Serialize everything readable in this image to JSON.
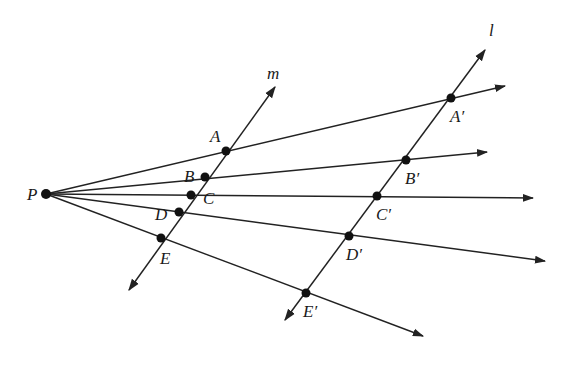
{
  "diagram": {
    "type": "geometry",
    "stroke_color": "#222222",
    "point_color": "#111111",
    "origin": {
      "label": "P",
      "x": 46,
      "y": 194,
      "label_x": 27,
      "label_y": 186
    },
    "lines": [
      {
        "name": "m",
        "label": "m",
        "x1": 129,
        "y1": 290,
        "x2": 275,
        "y2": 87,
        "label_x": 267,
        "label_y": 65,
        "arrow_both": true
      },
      {
        "name": "l",
        "label": "l",
        "x1": 285,
        "y1": 320,
        "x2": 485,
        "y2": 50,
        "label_x": 489,
        "label_y": 22,
        "arrow_both": true
      }
    ],
    "points_on_m": [
      {
        "label": "A",
        "x": 226,
        "y": 151,
        "label_x": 210,
        "label_y": 128
      },
      {
        "label": "B",
        "x": 205,
        "y": 177,
        "label_x": 184,
        "label_y": 168
      },
      {
        "label": "C",
        "x": 191,
        "y": 195,
        "label_x": 203,
        "label_y": 190
      },
      {
        "label": "D",
        "x": 179,
        "y": 212,
        "label_x": 155,
        "label_y": 206
      },
      {
        "label": "E",
        "x": 161,
        "y": 238,
        "label_x": 160,
        "label_y": 250
      }
    ],
    "points_on_l": [
      {
        "label": "A′",
        "x": 451,
        "y": 98,
        "label_x": 450,
        "label_y": 108
      },
      {
        "label": "B′",
        "x": 406,
        "y": 160,
        "label_x": 405,
        "label_y": 170
      },
      {
        "label": "C′",
        "x": 377,
        "y": 196,
        "label_x": 376,
        "label_y": 206
      },
      {
        "label": "D′",
        "x": 349,
        "y": 236,
        "label_x": 346,
        "label_y": 246
      },
      {
        "label": "E′",
        "x": 306,
        "y": 293,
        "label_x": 303,
        "label_y": 303
      }
    ],
    "rays": [
      {
        "through": "A",
        "x2": 505,
        "y2": 86
      },
      {
        "through": "B",
        "x2": 487,
        "y2": 152
      },
      {
        "through": "C",
        "x2": 533,
        "y2": 198
      },
      {
        "through": "D",
        "x2": 545,
        "y2": 261
      },
      {
        "through": "E",
        "x2": 423,
        "y2": 336
      }
    ]
  }
}
